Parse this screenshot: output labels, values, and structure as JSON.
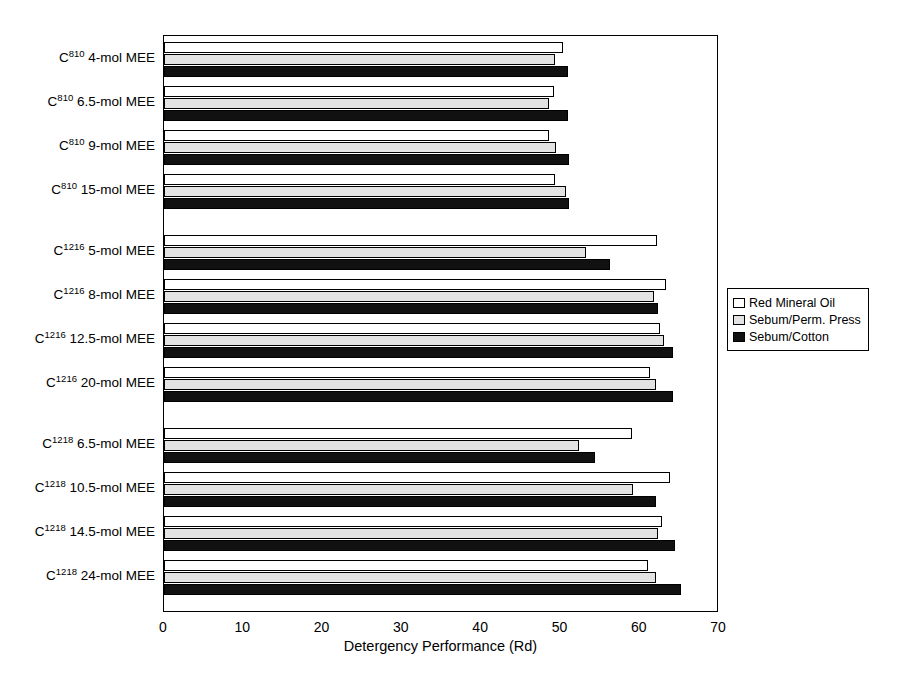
{
  "chart_data": {
    "type": "bar",
    "orientation": "horizontal",
    "title": "",
    "xlabel": "Detergency Performance (Rd)",
    "ylabel": "",
    "xlim": [
      0,
      70
    ],
    "xticks": [
      0,
      10,
      20,
      30,
      40,
      50,
      60,
      70
    ],
    "grid": false,
    "legend_position": "right",
    "categories": [
      "C810 4-mol MEE",
      "C810 6.5-mol MEE",
      "C810 9-mol MEE",
      "C810 15-mol MEE",
      "C1216 5-mol MEE",
      "C1216 8-mol MEE",
      "C1216 12.5-mol MEE",
      "C1216 20-mol MEE",
      "C1218 6.5-mol MEE",
      "C1218 10.5-mol MEE",
      "C1218 14.5-mol MEE",
      "C1218 24-mol MEE"
    ],
    "category_labels": [
      {
        "base": "C",
        "sup": "810",
        "rest": " 4-mol MEE"
      },
      {
        "base": "C",
        "sup": "810",
        "rest": " 6.5-mol MEE"
      },
      {
        "base": "C",
        "sup": "810",
        "rest": " 9-mol MEE"
      },
      {
        "base": "C",
        "sup": "810",
        "rest": " 15-mol MEE"
      },
      {
        "base": "C",
        "sup": "1216",
        "rest": " 5-mol MEE"
      },
      {
        "base": "C",
        "sup": "1216",
        "rest": " 8-mol MEE"
      },
      {
        "base": "C",
        "sup": "1216",
        "rest": " 12.5-mol MEE"
      },
      {
        "base": "C",
        "sup": "1216",
        "rest": " 20-mol MEE"
      },
      {
        "base": "C",
        "sup": "1218",
        "rest": " 6.5-mol MEE"
      },
      {
        "base": "C",
        "sup": "1218",
        "rest": " 10.5-mol MEE"
      },
      {
        "base": "C",
        "sup": "1218",
        "rest": " 14.5-mol MEE"
      },
      {
        "base": "C",
        "sup": "1218",
        "rest": " 24-mol MEE"
      }
    ],
    "group_breaks_after": [
      3,
      7
    ],
    "series": [
      {
        "name": "Red Mineral Oil",
        "color": "#ffffff",
        "values": [
          50.3,
          49.2,
          48.5,
          49.3,
          62.2,
          63.3,
          62.6,
          61.3,
          59.0,
          63.8,
          62.8,
          61.1
        ]
      },
      {
        "name": "Sebum/Perm. Press",
        "color": "#e3e3e3",
        "values": [
          49.3,
          48.6,
          49.4,
          50.7,
          53.2,
          61.8,
          63.0,
          62.0,
          52.3,
          59.2,
          62.3,
          62.0
        ]
      },
      {
        "name": "Sebum/Cotton",
        "color": "#111111",
        "values": [
          50.9,
          51.0,
          51.1,
          51.1,
          56.3,
          62.3,
          64.2,
          64.2,
          54.4,
          62.1,
          64.4,
          65.2
        ]
      }
    ]
  },
  "legend": {
    "items": [
      {
        "label": "Red Mineral Oil",
        "swatch": "#ffffff"
      },
      {
        "label": "Sebum/Perm. Press",
        "swatch": "#e3e3e3"
      },
      {
        "label": "Sebum/Cotton",
        "swatch": "#111111"
      }
    ]
  }
}
